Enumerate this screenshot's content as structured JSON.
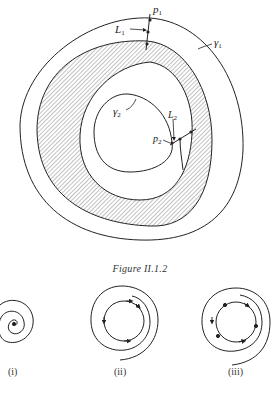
{
  "figure": {
    "caption": "Figure II.1.2",
    "labels": {
      "p1": "p",
      "p1_sub": "1",
      "L1": "L",
      "L1_sub": "1",
      "gamma1": "γ",
      "gamma1_sub": "1",
      "gamma2": "γ",
      "gamma2_sub": "2",
      "L2": "L",
      "L2_sub": "2",
      "p2": "p",
      "p2_sub": "2"
    },
    "colors": {
      "ink": "#222222",
      "hatch": "#555555",
      "background": "#ffffff"
    }
  },
  "subfigures": [
    {
      "label": "(i)",
      "description": "spiral converging to a point"
    },
    {
      "label": "(ii)",
      "description": "spiral approaching a periodic orbit"
    },
    {
      "label": "(iii)",
      "description": "spiral approaching a cycle with equilibrium points"
    }
  ]
}
